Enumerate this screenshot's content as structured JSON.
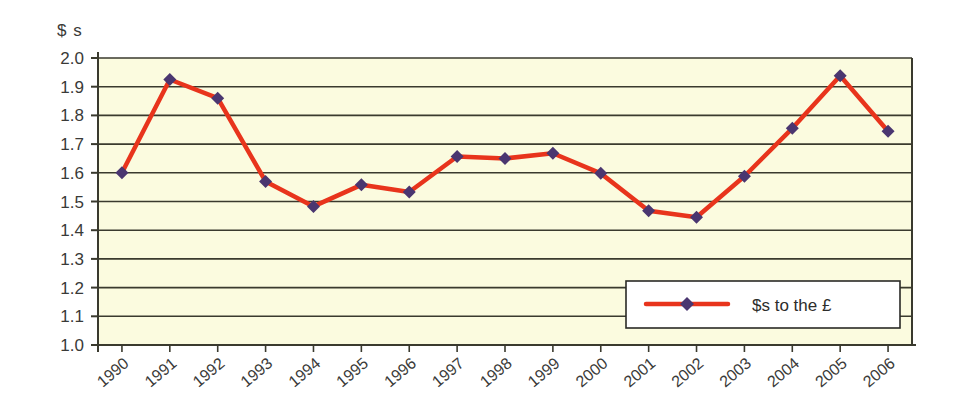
{
  "chart_data": {
    "type": "line",
    "title": "",
    "subtitle": "",
    "xlabel": "",
    "ylabel": "$ s",
    "ylim": [
      1.0,
      2.0
    ],
    "ytick_step": 0.1,
    "grid": true,
    "legend_position": "inside-bottom-right",
    "categories": [
      "1990",
      "1991",
      "1992",
      "1993",
      "1994",
      "1995",
      "1996",
      "1997",
      "1998",
      "1999",
      "2000",
      "2001",
      "2002",
      "2003",
      "2004",
      "2005",
      "2006"
    ],
    "ytick_labels": [
      "2.0",
      "1.9",
      "1.8",
      "1.7",
      "1.6",
      "1.5",
      "1.4",
      "1.3",
      "1.2",
      "1.1",
      "1.0"
    ],
    "series": [
      {
        "name": "$s to the £",
        "line_color": "#e8341c",
        "marker_color": "#4a3670",
        "marker": "diamond",
        "values": [
          1.6,
          1.925,
          1.86,
          1.57,
          1.483,
          1.558,
          1.533,
          1.657,
          1.65,
          1.668,
          1.598,
          1.468,
          1.445,
          1.588,
          1.755,
          1.938,
          1.745
        ]
      }
    ]
  },
  "legend": {
    "entries": [
      {
        "label": "$s to the £"
      }
    ]
  },
  "axes": {
    "y_axis_title": "$ s"
  },
  "colors": {
    "plot_background": "#fbfbdf",
    "line": "#e8341c",
    "marker": "#4a3670",
    "gridline": "#3a3a2e",
    "axis": "#3a3a2e",
    "text": "#3a3a38",
    "page_background": "#ffffff"
  }
}
